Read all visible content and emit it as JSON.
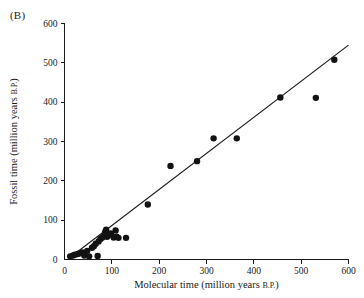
{
  "figure": {
    "panel_label": "(B)",
    "background_color": "#ffffff",
    "ink_color": "#1a1a1a"
  },
  "chart_data": {
    "type": "scatter",
    "title": "",
    "panel": "(B)",
    "xlabel": "Molecular time (million years B.P.)",
    "xlabel_main": "Molecular time (million years ",
    "xlabel_smallcaps": "B.P.",
    "xlabel_tail": ")",
    "ylabel": "Fossil time (million years B.P.)",
    "ylabel_main": "Fossil time (million years ",
    "ylabel_smallcaps": "B.P.",
    "ylabel_tail": ")",
    "xlim": [
      0,
      600
    ],
    "ylim": [
      0,
      600
    ],
    "xticks": [
      0,
      100,
      200,
      300,
      400,
      500,
      600
    ],
    "yticks": [
      0,
      100,
      200,
      300,
      400,
      500,
      600
    ],
    "xtick_labels": [
      "0",
      "100",
      "200",
      "300",
      "400",
      "500",
      "600"
    ],
    "ytick_labels": [
      "0",
      "100",
      "200",
      "300",
      "400",
      "500",
      "600"
    ],
    "grid": false,
    "legend": false,
    "marker": "filled-circle",
    "marker_color": "#121212",
    "marker_size": 3.2,
    "points": [
      [
        12,
        8
      ],
      [
        18,
        10
      ],
      [
        22,
        12
      ],
      [
        28,
        14
      ],
      [
        33,
        16
      ],
      [
        38,
        18
      ],
      [
        42,
        10
      ],
      [
        48,
        22
      ],
      [
        52,
        8
      ],
      [
        58,
        30
      ],
      [
        62,
        34
      ],
      [
        66,
        40
      ],
      [
        70,
        9
      ],
      [
        72,
        46
      ],
      [
        76,
        52
      ],
      [
        80,
        56
      ],
      [
        84,
        60
      ],
      [
        86,
        70
      ],
      [
        88,
        76
      ],
      [
        90,
        58
      ],
      [
        94,
        62
      ],
      [
        98,
        66
      ],
      [
        104,
        56
      ],
      [
        108,
        74
      ],
      [
        110,
        58
      ],
      [
        114,
        55
      ],
      [
        130,
        55
      ],
      [
        176,
        140
      ],
      [
        224,
        238
      ],
      [
        280,
        250
      ],
      [
        315,
        308
      ],
      [
        364,
        308
      ],
      [
        456,
        412
      ],
      [
        531,
        411
      ],
      [
        570,
        508
      ]
    ],
    "fit_line": {
      "label": "regression line",
      "x_start": 8,
      "y_start": 2,
      "x_end": 600,
      "y_end": 545
    }
  }
}
